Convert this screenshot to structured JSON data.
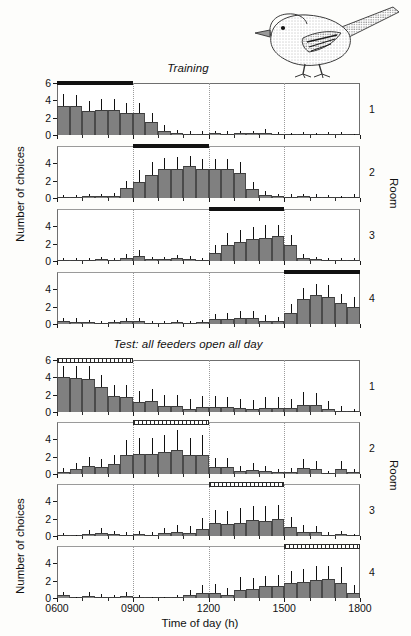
{
  "figure": {
    "xlabel": "Time of day (h)",
    "ylabel": "Number of choices",
    "room_label": "Room",
    "bird_icon": "songbird-illustration"
  },
  "sections": [
    {
      "id": "training",
      "title": "Training"
    },
    {
      "id": "test",
      "title": "Test: all feeders open all day"
    }
  ],
  "axis": {
    "x_ticks": [
      "0600",
      "0900",
      "1200",
      "1500",
      "1800"
    ],
    "x_min": 600,
    "x_max": 1800,
    "y_ticks_top": [
      "0",
      "2",
      "4",
      "6"
    ],
    "y_ticks": [
      "0",
      "2",
      "4"
    ],
    "y_min": 0,
    "y_max": 6
  },
  "rooms": [
    "1",
    "2",
    "3",
    "4"
  ],
  "chart_data": {
    "type": "bar",
    "xlabel": "Time of day (h)",
    "ylabel": "Number of choices",
    "xlim": [
      600,
      1800
    ],
    "ylim": [
      0,
      6
    ],
    "grid": "vertical dotted guides at 0900, 1200, 1500",
    "bin_width_minutes": 30,
    "bin_centers": [
      615,
      645,
      715,
      745,
      815,
      845,
      915,
      945,
      1015,
      1045,
      1115,
      1145,
      1215,
      1245,
      1315,
      1345,
      1415,
      1445,
      1515,
      1545,
      1615,
      1645,
      1715,
      1745
    ],
    "error_bars": "upward standard deviation",
    "panels": [
      {
        "section": "training",
        "room": "1",
        "feeder_open_window": [
          600,
          900
        ],
        "feeder_bar_style": "filled",
        "values": [
          3.4,
          3.4,
          2.8,
          2.9,
          2.9,
          2.5,
          2.5,
          1.5,
          0.5,
          0.2,
          0.15,
          0.15,
          0.2,
          0.15,
          0.2,
          0.2,
          0.25,
          0.1,
          0.05,
          0.1,
          0.05,
          0.1,
          0.1,
          0.05
        ],
        "errors": [
          1.3,
          1.2,
          1.1,
          1.2,
          1.2,
          1.2,
          1.2,
          1.0,
          0.6,
          0.4,
          0.3,
          0.3,
          0.3,
          0.3,
          0.3,
          0.3,
          0.4,
          0.2,
          0.15,
          0.2,
          0.15,
          0.2,
          0.2,
          0.1
        ]
      },
      {
        "section": "training",
        "room": "2",
        "feeder_open_window": [
          900,
          1200
        ],
        "feeder_bar_style": "filled",
        "values": [
          0.1,
          0.15,
          0.2,
          0.2,
          0.25,
          1.1,
          1.9,
          2.7,
          3.3,
          3.3,
          3.7,
          3.3,
          3.3,
          3.3,
          2.9,
          1.0,
          0.35,
          0.2,
          0.15,
          0.2,
          0.15,
          0.1,
          0.05,
          0.15
        ],
        "errors": [
          0.2,
          0.25,
          0.3,
          0.3,
          0.35,
          0.9,
          1.3,
          1.4,
          1.3,
          1.4,
          1.2,
          1.2,
          1.2,
          1.2,
          1.3,
          0.9,
          0.5,
          0.3,
          0.3,
          0.3,
          0.3,
          0.2,
          0.15,
          0.3
        ]
      },
      {
        "section": "training",
        "room": "3",
        "feeder_open_window": [
          1200,
          1500
        ],
        "feeder_bar_style": "filled",
        "values": [
          0.15,
          0.1,
          0.15,
          0.2,
          0.15,
          0.35,
          0.55,
          0.2,
          0.2,
          0.3,
          0.25,
          0.15,
          0.95,
          1.9,
          2.2,
          2.5,
          2.6,
          2.85,
          1.8,
          0.35,
          0.2,
          0.15,
          0.1,
          0.1
        ],
        "errors": [
          0.25,
          0.2,
          0.25,
          0.3,
          0.25,
          0.5,
          0.7,
          0.3,
          0.3,
          0.4,
          0.35,
          0.25,
          0.9,
          1.3,
          1.4,
          1.4,
          1.5,
          1.3,
          1.2,
          0.5,
          0.3,
          0.25,
          0.2,
          0.2
        ]
      },
      {
        "section": "training",
        "room": "4",
        "feeder_open_window": [
          1500,
          1800
        ],
        "feeder_bar_style": "filled",
        "values": [
          0.3,
          0.25,
          0.2,
          0.15,
          0.2,
          0.3,
          0.3,
          0.15,
          0.1,
          0.2,
          0.15,
          0.2,
          0.55,
          0.6,
          0.65,
          0.65,
          0.4,
          0.35,
          1.3,
          2.85,
          3.3,
          3.1,
          2.4,
          2.0
        ],
        "errors": [
          0.4,
          0.4,
          0.3,
          0.25,
          0.3,
          0.4,
          0.4,
          0.25,
          0.2,
          0.3,
          0.25,
          0.3,
          0.6,
          0.7,
          0.8,
          0.8,
          0.6,
          0.5,
          1.0,
          1.3,
          1.3,
          1.4,
          1.1,
          1.1
        ]
      },
      {
        "section": "test",
        "room": "1",
        "feeder_open_window": [
          600,
          900
        ],
        "feeder_bar_style": "open",
        "values": [
          4.0,
          3.9,
          3.8,
          2.85,
          1.8,
          1.7,
          1.15,
          1.3,
          0.75,
          0.65,
          0.4,
          0.6,
          0.6,
          0.55,
          0.45,
          0.35,
          0.5,
          0.5,
          0.45,
          0.85,
          0.8,
          0.35,
          0.15,
          0.05
        ],
        "errors": [
          1.3,
          1.4,
          1.5,
          1.4,
          1.3,
          1.4,
          1.3,
          1.4,
          1.2,
          1.3,
          1.1,
          1.3,
          1.3,
          1.2,
          1.1,
          1.0,
          1.2,
          1.2,
          1.1,
          1.5,
          1.4,
          0.9,
          0.5,
          0.25
        ]
      },
      {
        "section": "test",
        "room": "2",
        "feeder_open_window": [
          900,
          1200
        ],
        "feeder_bar_style": "open",
        "values": [
          0.25,
          0.6,
          0.95,
          0.8,
          1.1,
          2.25,
          2.3,
          2.3,
          2.5,
          2.75,
          2.2,
          2.2,
          0.85,
          0.8,
          0.35,
          0.5,
          0.3,
          0.2,
          0.25,
          0.7,
          0.55,
          0.1,
          0.6,
          0.2
        ],
        "errors": [
          0.4,
          0.7,
          1.0,
          0.9,
          1.1,
          1.7,
          1.9,
          1.9,
          2.0,
          2.3,
          1.9,
          2.3,
          1.0,
          1.1,
          0.6,
          0.8,
          0.6,
          0.4,
          0.5,
          1.0,
          0.9,
          0.25,
          0.9,
          0.4
        ]
      },
      {
        "section": "test",
        "room": "3",
        "feeder_open_window": [
          1200,
          1500
        ],
        "feeder_bar_style": "open",
        "values": [
          0.1,
          0.05,
          0.25,
          0.35,
          0.2,
          0.15,
          0.2,
          0.15,
          0.35,
          0.5,
          0.4,
          0.85,
          1.45,
          1.4,
          1.55,
          1.8,
          1.7,
          1.95,
          1.05,
          0.5,
          0.45,
          0.15,
          0.2,
          0.05
        ],
        "errors": [
          0.2,
          0.1,
          0.5,
          0.6,
          0.4,
          0.3,
          0.4,
          0.3,
          0.6,
          0.8,
          0.7,
          1.2,
          1.6,
          1.5,
          1.7,
          1.7,
          1.8,
          1.6,
          1.2,
          0.8,
          0.7,
          0.35,
          0.4,
          0.15
        ]
      },
      {
        "section": "test",
        "room": "4",
        "feeder_open_window": [
          1500,
          1800
        ],
        "feeder_bar_style": "open",
        "values": [
          0.3,
          0.05,
          0.25,
          0.15,
          0.1,
          0.25,
          0.1,
          0.05,
          0.05,
          0.1,
          0.35,
          0.55,
          0.6,
          0.4,
          0.95,
          1.05,
          1.35,
          1.4,
          1.75,
          1.8,
          2.1,
          2.2,
          1.7,
          0.6
        ],
        "errors": [
          0.4,
          0.1,
          0.4,
          0.3,
          0.2,
          0.4,
          0.2,
          0.1,
          0.1,
          0.2,
          0.6,
          0.9,
          1.0,
          0.7,
          1.5,
          1.3,
          1.2,
          1.3,
          1.4,
          1.6,
          1.6,
          1.5,
          1.9,
          0.9
        ]
      }
    ]
  }
}
